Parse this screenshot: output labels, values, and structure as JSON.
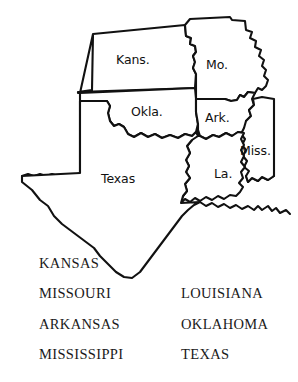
{
  "figure": {
    "kind": "outline-map",
    "region": "South Central United States",
    "background_color": "#ffffff",
    "outline_color": "#111111",
    "fill_color": "#ffffff"
  },
  "map": {
    "labels": [
      {
        "name": "kansas",
        "text": "Kans.",
        "x": 116,
        "y": 52
      },
      {
        "name": "missouri",
        "text": "Mo.",
        "x": 212,
        "y": 60
      },
      {
        "name": "oklahoma",
        "text": "Okla.",
        "x": 132,
        "y": 105
      },
      {
        "name": "arkansas",
        "text": "Ark.",
        "x": 207,
        "y": 110
      },
      {
        "name": "mississippi",
        "text": "Miss.",
        "x": 243,
        "y": 144
      },
      {
        "name": "texas",
        "text": "Texas",
        "x": 102,
        "y": 170
      },
      {
        "name": "louisiana",
        "text": "La.",
        "x": 215,
        "y": 168
      }
    ]
  },
  "legend": {
    "rows": [
      {
        "left": "KANSAS",
        "right": ""
      },
      {
        "left": "MISSOURI",
        "right": "LOUISIANA"
      },
      {
        "left": "ARKANSAS",
        "right": "OKLAHOMA"
      },
      {
        "left": "MISSISSIPPI",
        "right": "TEXAS"
      }
    ]
  }
}
